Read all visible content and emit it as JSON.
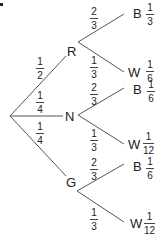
{
  "diagram": {
    "type": "probability-tree",
    "root": {
      "label": ""
    },
    "first_level": [
      {
        "label": "R",
        "probability": {
          "num": "1",
          "den": "2"
        },
        "outcomes": [
          {
            "label": "B",
            "branch": {
              "num": "2",
              "den": "3"
            },
            "joint": {
              "num": "1",
              "den": "3"
            }
          },
          {
            "label": "W",
            "branch": {
              "num": "1",
              "den": "3"
            },
            "joint": {
              "num": "1",
              "den": "6"
            }
          }
        ]
      },
      {
        "label": "N",
        "probability": {
          "num": "1",
          "den": "4"
        },
        "outcomes": [
          {
            "label": "B",
            "branch": {
              "num": "2",
              "den": "3"
            },
            "joint": {
              "num": "1",
              "den": "6"
            }
          },
          {
            "label": "W",
            "branch": {
              "num": "1",
              "den": "3"
            },
            "joint": {
              "num": "1",
              "den": "12"
            }
          }
        ]
      },
      {
        "label": "G",
        "probability": {
          "num": "1",
          "den": "4"
        },
        "outcomes": [
          {
            "label": "B",
            "branch": {
              "num": "2",
              "den": "3"
            },
            "joint": {
              "num": "1",
              "den": "6"
            }
          },
          {
            "label": "W",
            "branch": {
              "num": "1",
              "den": "3"
            },
            "joint": {
              "num": "1",
              "den": "12"
            }
          }
        ]
      }
    ],
    "colors": {
      "line": "#555555",
      "text": "#222222"
    }
  }
}
